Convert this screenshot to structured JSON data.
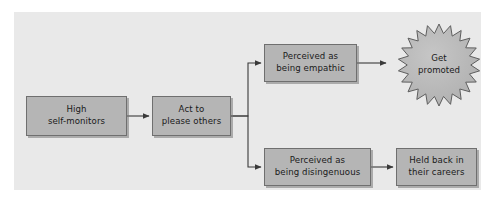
{
  "diagram": {
    "background_color": "#ffffff",
    "panel_color": "#e9e9e9",
    "node_fill": "#b5b5b5",
    "node_border": "#6f6f6f",
    "connector_color": "#3a3a3a",
    "nodes": [
      {
        "id": "high-self-monitors",
        "label": "High\nself-monitors",
        "shape": "rectangle",
        "x": 26,
        "y": 96,
        "width": 101,
        "height": 40
      },
      {
        "id": "act-to-please-others",
        "label": "Act to\nplease others",
        "shape": "rectangle",
        "x": 152,
        "y": 96,
        "width": 79,
        "height": 40
      },
      {
        "id": "perceived-as-being-empathic",
        "label": "Perceived as\nbeing empathic",
        "shape": "rectangle",
        "x": 264,
        "y": 44,
        "width": 93,
        "height": 38
      },
      {
        "id": "perceived-as-being-disingenuous",
        "label": "Perceived as\nbeing disingenuous",
        "shape": "rectangle",
        "x": 264,
        "y": 148,
        "width": 107,
        "height": 38
      },
      {
        "id": "held-back-in-their-careers",
        "label": "Held back in\ntheir careers",
        "shape": "rectangle",
        "x": 396,
        "y": 148,
        "width": 81,
        "height": 38
      },
      {
        "id": "get-promoted",
        "label": "Get\npromoted",
        "shape": "starburst",
        "x": 398,
        "y": 24,
        "width": 82,
        "height": 82,
        "points": 22
      }
    ],
    "connectors": [
      {
        "id": "high-self-monitors-to-act-to-please-others",
        "from": "high-self-monitors",
        "to": "act-to-please-others",
        "style": "straight-arrow"
      },
      {
        "id": "act-to-please-others-to-perceived-as-being-empathic",
        "from": "act-to-please-others",
        "to": "perceived-as-being-empathic",
        "style": "elbow-arrow-up"
      },
      {
        "id": "act-to-please-others-to-perceived-as-being-disingenuous",
        "from": "act-to-please-others",
        "to": "perceived-as-being-disingenuous",
        "style": "elbow-arrow-down"
      },
      {
        "id": "perceived-as-being-empathic-to-get-promoted",
        "from": "perceived-as-being-empathic",
        "to": "get-promoted",
        "style": "straight-arrow"
      },
      {
        "id": "perceived-as-being-disingenuous-to-held-back-in-their-careers",
        "from": "perceived-as-being-disingenuous",
        "to": "held-back-in-their-careers",
        "style": "straight-arrow"
      }
    ]
  }
}
